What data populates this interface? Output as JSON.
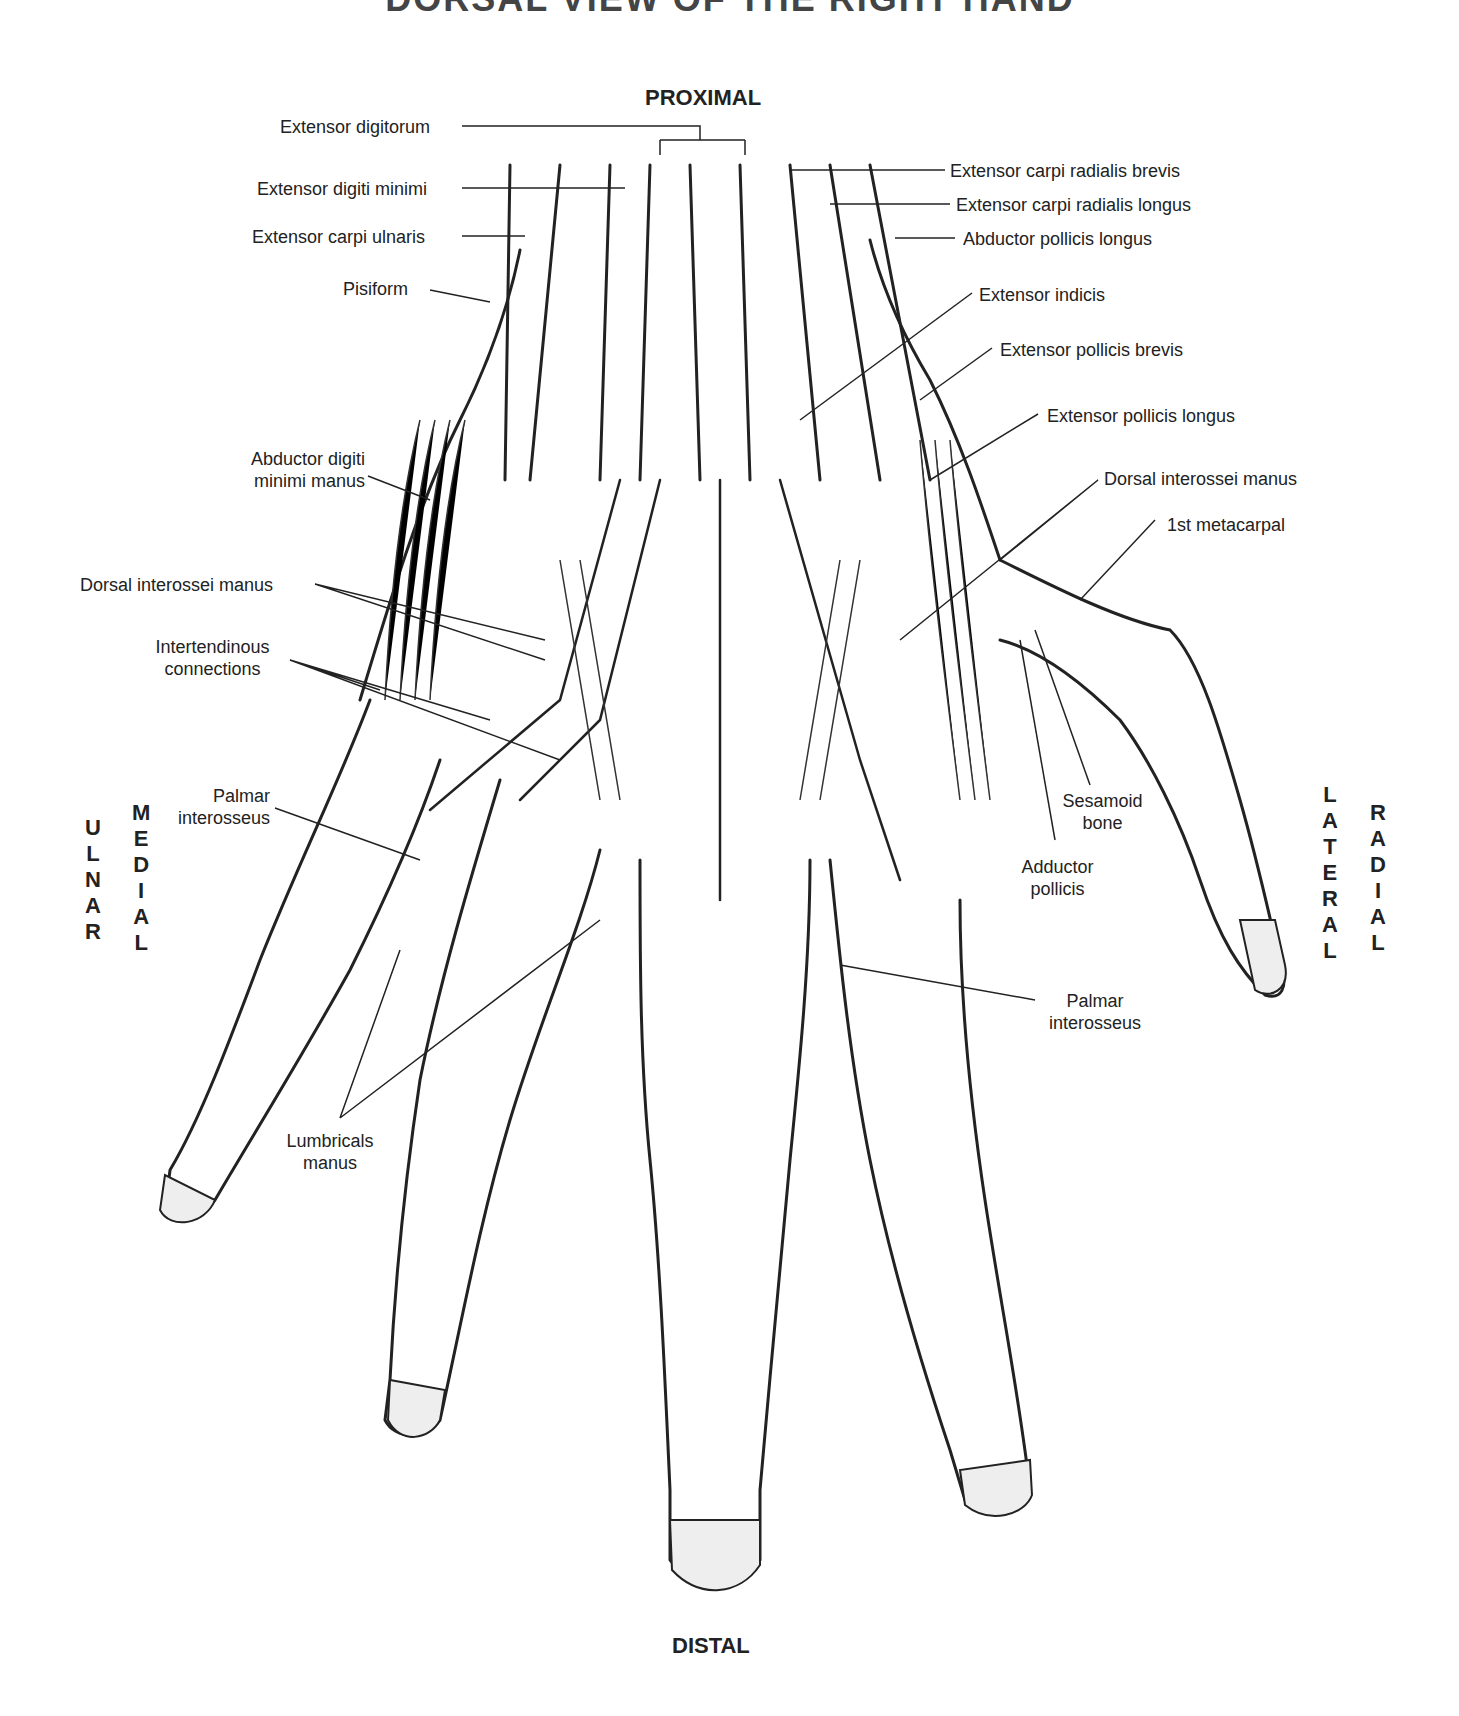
{
  "title": "DORSAL VIEW OF THE RIGHT HAND",
  "orientation": {
    "top": "PROXIMAL",
    "bottom": "DISTAL",
    "left_outer": "ULNAR",
    "left_inner": "MEDIAL",
    "right_inner": "LATERAL",
    "right_outer": "RADIAL"
  },
  "labels_left": [
    {
      "id": "extensor-digitorum",
      "text": "Extensor digitorum"
    },
    {
      "id": "extensor-digiti-minimi",
      "text": "Extensor digiti minimi"
    },
    {
      "id": "extensor-carpi-ulnaris",
      "text": "Extensor carpi ulnaris"
    },
    {
      "id": "pisiform",
      "text": "Pisiform"
    },
    {
      "id": "abductor-digiti-minimi-manus",
      "line1": "Abductor digiti",
      "line2": "minimi manus"
    },
    {
      "id": "dorsal-interossei-manus-left",
      "text": "Dorsal interossei manus"
    },
    {
      "id": "intertendinous-connections",
      "line1": "Intertendinous",
      "line2": "connections"
    },
    {
      "id": "palmar-interosseus-left",
      "line1": "Palmar",
      "line2": "interosseus"
    },
    {
      "id": "lumbricals-manus",
      "line1": "Lumbricals",
      "line2": "manus"
    }
  ],
  "labels_right": [
    {
      "id": "extensor-carpi-radialis-brevis",
      "text": "Extensor carpi radialis brevis"
    },
    {
      "id": "extensor-carpi-radialis-longus",
      "text": "Extensor carpi radialis longus"
    },
    {
      "id": "abductor-pollicis-longus",
      "text": "Abductor pollicis longus"
    },
    {
      "id": "extensor-indicis",
      "text": "Extensor indicis"
    },
    {
      "id": "extensor-pollicis-brevis",
      "text": "Extensor pollicis brevis"
    },
    {
      "id": "extensor-pollicis-longus",
      "text": "Extensor pollicis longus"
    },
    {
      "id": "dorsal-interossei-manus-right",
      "text": "Dorsal interossei manus"
    },
    {
      "id": "first-metacarpal",
      "text": "1st metacarpal"
    },
    {
      "id": "sesamoid-bone",
      "line1": "Sesamoid",
      "line2": "bone"
    },
    {
      "id": "adductor-pollicis",
      "line1": "Adductor",
      "line2": "pollicis"
    },
    {
      "id": "palmar-interosseus-right",
      "line1": "Palmar",
      "line2": "interosseus"
    }
  ],
  "colors": {
    "ink": "#222222",
    "background": "#ffffff",
    "stipple": "#555555"
  }
}
